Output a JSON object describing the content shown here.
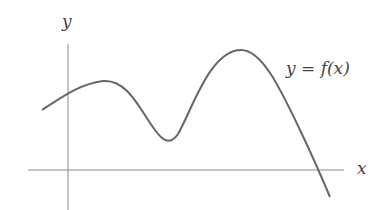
{
  "figure": {
    "y_axis_label": "y",
    "x_axis_label": "x",
    "curve_label": "y = f(x)",
    "colors": {
      "axes": "#888888",
      "curve": "#666666",
      "text": "#444444"
    }
  }
}
